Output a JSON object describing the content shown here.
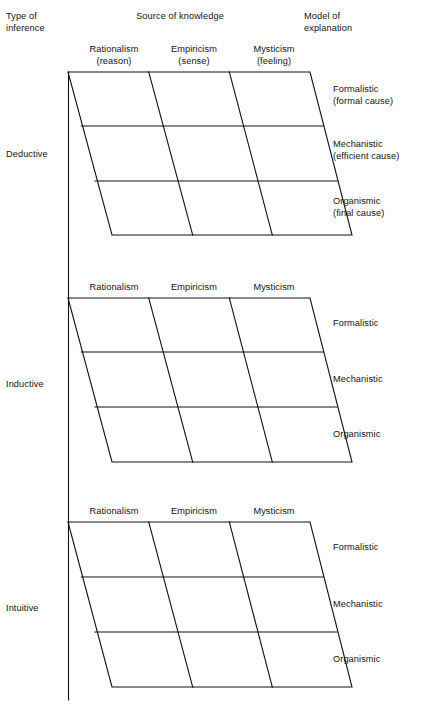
{
  "figure": {
    "axis_color": "#111111",
    "background": "#ffffff"
  },
  "headers": {
    "type_of_inference": "Type of\ninference",
    "source_of_knowledge": "Source of knowledge",
    "model_of_explanation": "Model of\nexplanation"
  },
  "blocks": [
    {
      "id": "deductive",
      "row_label": "Deductive",
      "columns": [
        "Rationalism\n(reason)",
        "Empiricism\n(sense)",
        "Mysticism\n(feeling)"
      ],
      "rows": [
        "Formalistic\n(formal cause)",
        "Mechanistic\n(efficient cause)",
        "Organismic\n(final cause)"
      ]
    },
    {
      "id": "inductive",
      "row_label": "Inductive",
      "columns": [
        "Rationalism",
        "Empiricism",
        "Mysticism"
      ],
      "rows": [
        "Formalistic",
        "Mechanistic",
        "Organismic"
      ]
    },
    {
      "id": "intuitive",
      "row_label": "Intuitive",
      "columns": [
        "Rationalism",
        "Empiricism",
        "Mysticism"
      ],
      "rows": [
        "Formalistic",
        "Mechanistic",
        "Organismic"
      ]
    }
  ]
}
